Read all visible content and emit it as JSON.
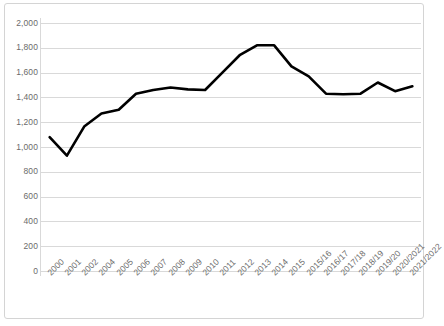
{
  "chart_data": {
    "type": "line",
    "title": "",
    "xlabel": "",
    "ylabel": "",
    "ylim": [
      0,
      2000
    ],
    "ytick_step": 200,
    "yticks": [
      "0",
      "200",
      "400",
      "600",
      "800",
      "1,000",
      "1,200",
      "1,400",
      "1,600",
      "1,800",
      "2,000"
    ],
    "grid": true,
    "legend": "none",
    "line_color": "#000000",
    "grid_color": "#d9d9d9",
    "background_color": "#ffffff",
    "border_color": "#d4d4d4",
    "categories": [
      "2000",
      "2001",
      "2002",
      "2004",
      "2005",
      "2006",
      "2007",
      "2008",
      "2009",
      "2010",
      "2011",
      "2012",
      "2013",
      "2014",
      "2015",
      "2015/16",
      "2016/17",
      "2017/18",
      "2018/19",
      "2019/20",
      "2020/2021",
      "2021/2022"
    ],
    "values": [
      1080,
      930,
      1165,
      1270,
      1300,
      1430,
      1460,
      1480,
      1465,
      1460,
      1600,
      1740,
      1820,
      1820,
      1650,
      1570,
      1430,
      1425,
      1430,
      1520,
      1450,
      1490
    ]
  }
}
